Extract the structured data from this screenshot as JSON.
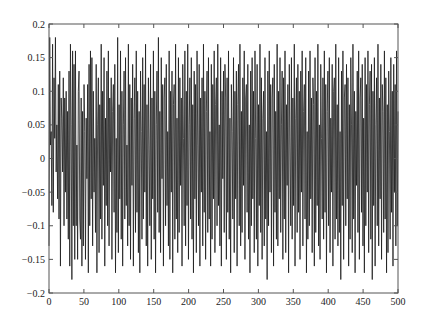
{
  "chart_data": {
    "type": "line",
    "title": "",
    "xlabel": "",
    "ylabel": "",
    "xlim": [
      0,
      500
    ],
    "ylim": [
      -0.2,
      0.2
    ],
    "grid": false,
    "legend": null,
    "xticks": [
      0,
      50,
      100,
      150,
      200,
      250,
      300,
      350,
      400,
      450,
      500
    ],
    "xtick_labels": [
      "0",
      "50",
      "100",
      "150",
      "200",
      "250",
      "300",
      "350",
      "400",
      "450",
      "500"
    ],
    "yticks": [
      -0.2,
      -0.15,
      -0.1,
      -0.05,
      0,
      0.05,
      0.1,
      0.15,
      0.2
    ],
    "ytick_labels": [
      "-0.2",
      "-0.15",
      "-0.1",
      "-0.05",
      "0",
      "0.05",
      "0.1",
      "0.15",
      "0.2"
    ],
    "line_color": "#1a1a1a",
    "series": [
      {
        "name": "signal",
        "note": "dense noise-like signal, ~500 samples, amplitude roughly -0.185 to 0.18",
        "values": [
          -0.13,
          0.18,
          0.02,
          0.04,
          -0.07,
          0.17,
          -0.08,
          0.12,
          0.03,
          0.18,
          -0.02,
          0.05,
          -0.06,
          0.11,
          -0.09,
          0.13,
          -0.16,
          0.09,
          0.06,
          -0.02,
          0.12,
          -0.1,
          0.09,
          -0.05,
          0.1,
          -0.09,
          0.07,
          -0.12,
          0.13,
          -0.16,
          0.17,
          0.05,
          -0.18,
          0.16,
          -0.1,
          0.14,
          -0.15,
          0.16,
          -0.1,
          0.02,
          -0.15,
          0.1,
          0.13,
          -0.09,
          -0.12,
          0.09,
          -0.16,
          0.07,
          -0.13,
          0.11,
          0.04,
          -0.15,
          0.06,
          -0.03,
          0.11,
          -0.17,
          0.14,
          -0.1,
          0.16,
          -0.06,
          0.15,
          -0.13,
          0.1,
          -0.05,
          0.03,
          -0.11,
          0.14,
          -0.17,
          0.05,
          0.12,
          -0.14,
          0.08,
          -0.09,
          0.17,
          -0.12,
          0.1,
          -0.04,
          0.15,
          -0.16,
          0.06,
          -0.07,
          0.13,
          -0.1,
          0.16,
          -0.13,
          0.09,
          -0.02,
          0.12,
          -0.15,
          0.07,
          0.11,
          -0.08,
          0.14,
          -0.17,
          0.03,
          -0.11,
          0.18,
          -0.14,
          0.08,
          -0.06,
          0.16,
          -0.12,
          0.1,
          -0.16,
          0.05,
          0.13,
          -0.09,
          0.15,
          -0.07,
          0.02,
          -0.13,
          0.17,
          -0.1,
          0.11,
          -0.15,
          0.09,
          -0.04,
          0.14,
          -0.16,
          0.06,
          0.12,
          -0.11,
          0.16,
          -0.08,
          0.1,
          -0.14,
          0.07,
          -0.17,
          0.13,
          0.04,
          -0.12,
          0.15,
          -0.09,
          0.11,
          -0.05,
          0.17,
          -0.13,
          0.08,
          -0.16,
          0.12,
          0.02,
          -0.1,
          0.14,
          -0.15,
          0.09,
          -0.06,
          0.16,
          -0.12,
          0.1,
          -0.17,
          0.05,
          0.13,
          -0.08,
          0.18,
          -0.11,
          0.07,
          -0.14,
          0.15,
          -0.03,
          0.11,
          -0.16,
          0.09,
          0.12,
          -0.1,
          0.14,
          -0.07,
          0.04,
          -0.13,
          0.16,
          -0.15,
          0.1,
          -0.05,
          0.13,
          -0.17,
          0.08,
          0.11,
          -0.12,
          0.17,
          -0.09,
          0.06,
          -0.14,
          0.15,
          -0.11,
          0.12,
          -0.04,
          0.09,
          -0.16,
          0.14,
          0.03,
          -0.1,
          0.16,
          -0.13,
          0.1,
          -0.07,
          0.17,
          -0.15,
          0.05,
          0.12,
          -0.09,
          0.15,
          -0.12,
          0.08,
          -0.17,
          0.13,
          -0.06,
          0.11,
          -0.14,
          0.16,
          0.02,
          -0.1,
          0.14,
          -0.16,
          0.09,
          -0.05,
          0.12,
          -0.13,
          0.17,
          -0.08,
          0.1,
          -0.15,
          0.07,
          0.13,
          -0.11,
          0.15,
          -0.09,
          0.04,
          -0.16,
          0.14,
          -0.12,
          0.11,
          -0.06,
          0.16,
          -0.14,
          0.08,
          0.12,
          -0.1,
          0.17,
          -0.07,
          0.05,
          -0.13,
          0.15,
          -0.16,
          0.1,
          -0.03,
          0.13,
          -0.11,
          0.14,
          0.09,
          -0.15,
          0.12,
          -0.08,
          0.16,
          -0.12,
          0.06,
          -0.17,
          0.11,
          0.04,
          -0.09,
          0.15,
          -0.14,
          0.1,
          -0.06,
          0.13,
          -0.16,
          0.08,
          0.14,
          -0.1,
          0.17,
          -0.13,
          0.07,
          -0.11,
          0.12,
          -0.04,
          0.16,
          -0.15,
          0.09,
          0.11,
          -0.08,
          0.14,
          -0.12,
          0.05,
          -0.17,
          0.13,
          -0.1,
          0.15,
          -0.06,
          0.1,
          -0.14,
          0.16,
          0.03,
          -0.12,
          0.14,
          -0.16,
          0.08,
          -0.07,
          0.17,
          -0.11,
          0.12,
          -0.15,
          0.06,
          0.1,
          -0.13,
          0.15,
          -0.09,
          0.04,
          -0.18,
          0.13,
          -0.1,
          0.16,
          -0.05,
          0.11,
          -0.14,
          0.09,
          0.12,
          -0.16,
          0.14,
          -0.08,
          0.07,
          -0.12,
          0.17,
          -0.13,
          0.1,
          -0.06,
          0.15,
          -0.11,
          0.05,
          0.13,
          -0.15,
          0.12,
          -0.09,
          0.16,
          -0.14,
          0.08,
          -0.04,
          0.11,
          -0.17,
          0.14,
          0.02,
          -0.1,
          0.15,
          -0.12,
          0.09,
          -0.07,
          0.17,
          -0.16,
          0.06,
          0.12,
          -0.11,
          0.14,
          -0.08,
          0.1,
          -0.15,
          0.13,
          -0.05,
          0.16,
          -0.13,
          0.07,
          0.11,
          -0.09,
          0.15,
          -0.17,
          0.04,
          -0.12,
          0.13,
          -0.1,
          0.16,
          -0.06,
          0.09,
          -0.14,
          0.12,
          0.08,
          -0.16,
          0.15,
          -0.11,
          0.1,
          -0.07,
          0.17,
          -0.13,
          0.05,
          -0.15,
          0.14,
          0.03,
          -0.09,
          0.12,
          -0.12,
          0.16,
          -0.08,
          0.11,
          -0.17,
          0.07,
          0.13,
          -0.1,
          0.15,
          -0.14,
          0.06,
          -0.05,
          0.14,
          -0.16,
          0.1,
          0.12,
          -0.12,
          0.17,
          -0.09,
          0.08,
          -0.13,
          0.15,
          -0.11,
          0.04,
          -0.18,
          0.13,
          -0.07,
          0.16,
          -0.15,
          0.09,
          0.11,
          -0.1,
          0.14,
          -0.06,
          0.12,
          -0.16,
          0.08,
          -0.12,
          0.15,
          0.05,
          -0.14,
          0.17,
          -0.09,
          0.1,
          -0.17,
          0.07,
          -0.04,
          0.13,
          -0.11,
          0.16,
          -0.15,
          0.09,
          0.12,
          -0.08,
          0.14,
          -0.13,
          0.06,
          -0.17,
          0.15,
          -0.1,
          0.11,
          -0.05,
          0.16,
          -0.14,
          0.08,
          0.13,
          -0.12,
          0.14,
          -0.18,
          0.1,
          -0.07,
          0.15,
          -0.16,
          0.05,
          0.12,
          -0.1,
          0.17,
          -0.13,
          0.09,
          -0.06,
          0.14,
          -0.15,
          0.11,
          0.07,
          -0.11,
          0.16,
          -0.09,
          0.12,
          -0.17,
          0.08,
          -0.14,
          0.13,
          0.04,
          -0.12,
          0.15,
          -0.08,
          0.1,
          -0.16,
          0.14,
          -0.05,
          0.11,
          -0.13,
          0.16,
          -0.1,
          0.07
        ]
      }
    ]
  }
}
